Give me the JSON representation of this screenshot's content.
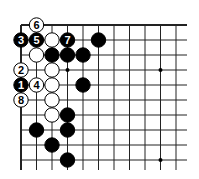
{
  "diagram": {
    "type": "go-board-fragment",
    "colors": {
      "black": "#000000",
      "white": "#ffffff",
      "line": "#222222",
      "background": "#ffffff"
    },
    "grid": {
      "origin_x": 21,
      "origin_y": 25,
      "col_spacing": 15.5,
      "row_spacing": 15,
      "cols": 11,
      "rows": 10,
      "extend_right_to": 187,
      "extend_bottom_to": 170,
      "top_edge": true,
      "left_edge": true
    },
    "star_points": [
      {
        "col": 4,
        "row": 4
      },
      {
        "col": 10,
        "row": 4
      },
      {
        "col": 10,
        "row": 10
      }
    ],
    "stones": [
      {
        "col": 2,
        "row": 1,
        "color": "white",
        "label": "6"
      },
      {
        "col": 1,
        "row": 2,
        "color": "black",
        "label": "3"
      },
      {
        "col": 2,
        "row": 2,
        "color": "black",
        "label": "5"
      },
      {
        "col": 3,
        "row": 2,
        "color": "white",
        "label": ""
      },
      {
        "col": 4,
        "row": 2,
        "color": "black",
        "label": "7"
      },
      {
        "col": 6,
        "row": 2,
        "color": "black",
        "label": ""
      },
      {
        "col": 2,
        "row": 3,
        "color": "white",
        "label": ""
      },
      {
        "col": 3,
        "row": 3,
        "color": "black",
        "label": ""
      },
      {
        "col": 4,
        "row": 3,
        "color": "black",
        "label": ""
      },
      {
        "col": 5,
        "row": 3,
        "color": "black",
        "label": ""
      },
      {
        "col": 1,
        "row": 4,
        "color": "white",
        "label": "2"
      },
      {
        "col": 3,
        "row": 4,
        "color": "white",
        "label": ""
      },
      {
        "col": 1,
        "row": 5,
        "color": "black",
        "label": "1"
      },
      {
        "col": 2,
        "row": 5,
        "color": "white",
        "label": "4"
      },
      {
        "col": 3,
        "row": 5,
        "color": "white",
        "label": ""
      },
      {
        "col": 5,
        "row": 5,
        "color": "black",
        "label": ""
      },
      {
        "col": 1,
        "row": 6,
        "color": "white",
        "label": "8"
      },
      {
        "col": 3,
        "row": 6,
        "color": "white",
        "label": ""
      },
      {
        "col": 3,
        "row": 7,
        "color": "white",
        "label": ""
      },
      {
        "col": 4,
        "row": 7,
        "color": "black",
        "label": ""
      },
      {
        "col": 2,
        "row": 8,
        "color": "black",
        "label": ""
      },
      {
        "col": 4,
        "row": 8,
        "color": "black",
        "label": ""
      },
      {
        "col": 3,
        "row": 9,
        "color": "black",
        "label": ""
      },
      {
        "col": 4,
        "row": 10,
        "color": "black",
        "label": ""
      }
    ]
  }
}
